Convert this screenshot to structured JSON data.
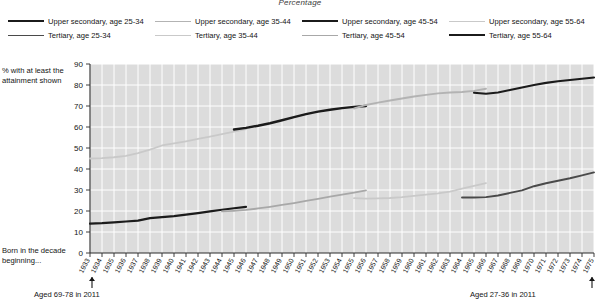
{
  "figure": {
    "title": "Percentage",
    "y_axis_note": "% with at least the attainment shown",
    "decade_note": "Born in the decade beginning...",
    "annotation_left": "Aged 69-78 in 2011",
    "annotation_right": "Aged 27-36 in 2011"
  },
  "legend": {
    "items": [
      {
        "label": "Upper secondary, age 25-34",
        "color": "#1b1b1b",
        "width": 2.0
      },
      {
        "label": "Upper secondary, age 35-44",
        "color": "#b3b3b3",
        "width": 1.5
      },
      {
        "label": "Upper secondary, age 45-54",
        "color": "#1b1b1b",
        "width": 2.4
      },
      {
        "label": "Upper secondary, age 55-64",
        "color": "#c9c9c9",
        "width": 1.5
      },
      {
        "label": "Tertiary, age 25-34",
        "color": "#4a4a4a",
        "width": 1.7
      },
      {
        "label": "Tertiary, age 35-44",
        "color": "#c9c9c9",
        "width": 1.5
      },
      {
        "label": "Tertiary, age 45-54",
        "color": "#a8a8a8",
        "width": 1.6
      },
      {
        "label": "Tertiary, age 55-64",
        "color": "#1b1b1b",
        "width": 2.2
      }
    ]
  },
  "chart_data": {
    "type": "line",
    "title": "Percentage",
    "xlabel": "Born in the decade beginning...",
    "ylabel": "% with at least the attainment shown",
    "xlim": [
      1933,
      1975
    ],
    "ylim": [
      0,
      90
    ],
    "yticks": [
      0,
      10,
      20,
      30,
      40,
      50,
      60,
      70,
      80,
      90
    ],
    "xticks": [
      1933,
      1934,
      1935,
      1936,
      1937,
      1938,
      1939,
      1940,
      1941,
      1942,
      1943,
      1944,
      1945,
      1946,
      1947,
      1948,
      1949,
      1950,
      1951,
      1952,
      1953,
      1954,
      1955,
      1956,
      1957,
      1958,
      1959,
      1960,
      1961,
      1962,
      1963,
      1964,
      1965,
      1966,
      1967,
      1968,
      1969,
      1970,
      1971,
      1972,
      1973,
      1974,
      1975
    ],
    "grid": true,
    "legend_position": "top",
    "series": [
      {
        "name": "Upper secondary, age 55-64",
        "color": "#c9c9c9",
        "width": 1.8,
        "x": [
          1933,
          1934,
          1935,
          1936,
          1937,
          1938,
          1939,
          1940,
          1941,
          1942,
          1943,
          1944,
          1945,
          1946
        ],
        "values": [
          45.0,
          45.2,
          45.6,
          46.3,
          47.6,
          49.2,
          51.2,
          52.2,
          53.2,
          54.3,
          55.4,
          56.6,
          57.8,
          59.0
        ]
      },
      {
        "name": "Upper secondary, age 45-54",
        "color": "#1b1b1b",
        "width": 2.4,
        "x": [
          1945,
          1946,
          1947,
          1948,
          1949,
          1950,
          1951,
          1952,
          1953,
          1954,
          1955,
          1956
        ],
        "values": [
          58.8,
          59.6,
          60.6,
          61.8,
          63.2,
          64.7,
          66.1,
          67.3,
          68.2,
          69.0,
          69.6,
          70.0
        ]
      },
      {
        "name": "Upper secondary, age 35-44",
        "color": "#b3b3b3",
        "width": 1.9,
        "x": [
          1955,
          1956,
          1957,
          1958,
          1959,
          1960,
          1961,
          1962,
          1963,
          1964,
          1965,
          1966
        ],
        "values": [
          68.8,
          70.5,
          71.6,
          72.6,
          73.6,
          74.5,
          75.3,
          76.0,
          76.4,
          76.7,
          77.2,
          78.2
        ]
      },
      {
        "name": "Upper secondary, age 25-34",
        "color": "#1b1b1b",
        "width": 2.1,
        "x": [
          1965,
          1966,
          1967,
          1968,
          1969,
          1970,
          1971,
          1972,
          1973,
          1974,
          1975
        ],
        "values": [
          76.3,
          75.8,
          76.4,
          77.6,
          78.8,
          80.0,
          81.0,
          81.8,
          82.4,
          83.0,
          83.6
        ]
      },
      {
        "name": "Tertiary, age 55-64",
        "color": "#1b1b1b",
        "width": 2.2,
        "x": [
          1933,
          1934,
          1935,
          1936,
          1937,
          1938,
          1939,
          1940,
          1941,
          1942,
          1943,
          1944,
          1945,
          1946
        ],
        "values": [
          14.0,
          14.2,
          14.6,
          15.0,
          15.4,
          16.6,
          17.1,
          17.6,
          18.3,
          19.0,
          19.8,
          20.6,
          21.3,
          22.0
        ]
      },
      {
        "name": "Tertiary, age 45-54",
        "color": "#a8a8a8",
        "width": 1.8,
        "x": [
          1944,
          1945,
          1946,
          1947,
          1948,
          1949,
          1950,
          1951,
          1952,
          1953,
          1954,
          1955,
          1956
        ],
        "values": [
          19.8,
          20.1,
          20.5,
          21.2,
          22.0,
          22.9,
          23.8,
          24.8,
          25.8,
          26.8,
          27.8,
          28.8,
          29.8
        ]
      },
      {
        "name": "Tertiary, age 35-44",
        "color": "#c9c9c9",
        "width": 1.8,
        "x": [
          1955,
          1956,
          1957,
          1958,
          1959,
          1960,
          1961,
          1962,
          1963,
          1964,
          1965,
          1966
        ],
        "values": [
          26.1,
          25.9,
          26.0,
          26.2,
          26.6,
          27.2,
          27.8,
          28.4,
          29.2,
          30.6,
          32.0,
          33.3
        ]
      },
      {
        "name": "Tertiary, age 25-34",
        "color": "#4a4a4a",
        "width": 1.9,
        "x": [
          1964,
          1965,
          1966,
          1967,
          1968,
          1969,
          1970,
          1971,
          1972,
          1973,
          1974,
          1975
        ],
        "values": [
          26.4,
          26.4,
          26.6,
          27.4,
          28.6,
          29.8,
          31.8,
          33.2,
          34.4,
          35.6,
          37.0,
          38.4
        ]
      }
    ]
  }
}
